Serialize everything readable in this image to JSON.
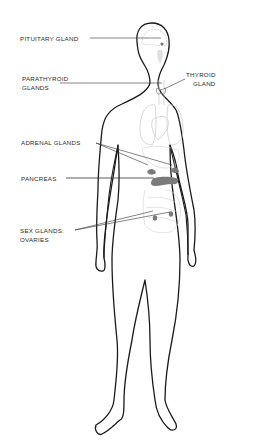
{
  "diagram": {
    "labels": [
      {
        "id": "pituitary",
        "lines": [
          "PITUITARY GLAND"
        ]
      },
      {
        "id": "parathyroid",
        "lines": [
          "PARATHYROID",
          "GLANDS"
        ]
      },
      {
        "id": "thyroid",
        "lines": [
          "THYROID",
          "GLAND"
        ]
      },
      {
        "id": "adrenal",
        "lines": [
          "ADRENAL GLANDS"
        ]
      },
      {
        "id": "pancreas",
        "lines": [
          "PANCREAS"
        ]
      },
      {
        "id": "sex-glands",
        "lines": [
          "SEX GLANDS:",
          "OVARIES"
        ]
      }
    ],
    "colors": {
      "outline": "#1a1a1a",
      "organs": "#c8c8c8",
      "glands": "#7a7a7a",
      "text": "#2a2a2a"
    }
  }
}
